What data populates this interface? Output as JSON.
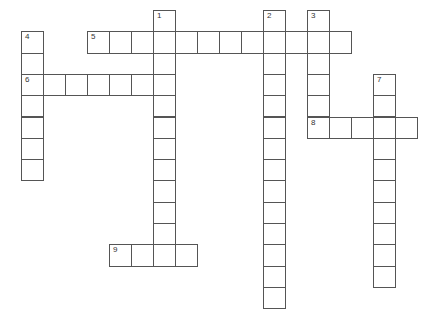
{
  "puzzle": {
    "type": "crossword",
    "cell_width": 22,
    "cell_height": 21.3,
    "origin_x": 21,
    "origin_y": 10,
    "border_color": "#555555",
    "entries": [
      {
        "number": "1",
        "direction": "down",
        "row": 0,
        "col": 6,
        "length": 12
      },
      {
        "number": "2",
        "direction": "down",
        "row": 0,
        "col": 11,
        "length": 14
      },
      {
        "number": "3",
        "direction": "down",
        "row": 0,
        "col": 13,
        "length": 6
      },
      {
        "number": "4",
        "direction": "down",
        "row": 1,
        "col": 0,
        "length": 7
      },
      {
        "number": "5",
        "direction": "across",
        "row": 1,
        "col": 3,
        "length": 12
      },
      {
        "number": "6",
        "direction": "across",
        "row": 3,
        "col": 0,
        "length": 7
      },
      {
        "number": "7",
        "direction": "down",
        "row": 3,
        "col": 16,
        "length": 10
      },
      {
        "number": "8",
        "direction": "across",
        "row": 5,
        "col": 13,
        "length": 5
      },
      {
        "number": "9",
        "direction": "across",
        "row": 11,
        "col": 4,
        "length": 4
      }
    ]
  }
}
